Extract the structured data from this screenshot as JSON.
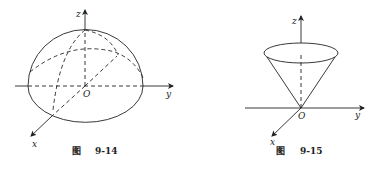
{
  "figures": [
    {
      "id": "fig-9-14",
      "shape": "hemisphere",
      "caption_prefix": "图",
      "caption_number": "9-14",
      "axis_labels": {
        "x": "x",
        "y": "y",
        "z": "z",
        "origin": "O"
      }
    },
    {
      "id": "fig-9-15",
      "shape": "cone",
      "caption_prefix": "图",
      "caption_number": "9-15",
      "axis_labels": {
        "x": "x",
        "y": "y",
        "z": "z",
        "origin": "O"
      }
    }
  ],
  "colors": {
    "stroke": "#222222",
    "background": "#ffffff"
  }
}
